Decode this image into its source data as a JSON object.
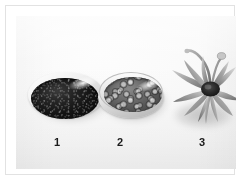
{
  "figure": {
    "kind": "specimen-comparison-photograph",
    "color_mode": "grayscale",
    "background_color": "#f5f5f5",
    "frame_color": "#e2e2e2",
    "label_color": "#1b1b1b"
  },
  "specimens": [
    {
      "label": "1",
      "name": "dark-fine-powder-in-dish",
      "container": "shallow round dish",
      "appearance": "dark near-black fine granular powder filling a round dish",
      "tone": "#141414"
    },
    {
      "label": "2",
      "name": "coarse-granules-in-dish",
      "container": "shallow petri-style dish",
      "appearance": "mid-grey coarse lumpy granules heaped in a shallow dish",
      "tone": "#6e6e6e"
    },
    {
      "label": "3",
      "name": "whole-plant-specimen",
      "container": "none",
      "appearance": "whole dried plant specimen, rosette of elongated leaves radiating from a central stem",
      "tone": "#8a8a8a"
    }
  ]
}
